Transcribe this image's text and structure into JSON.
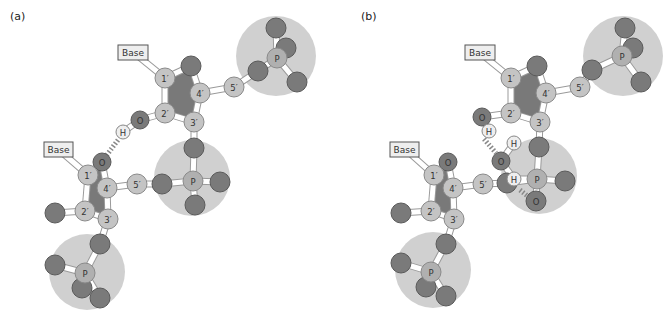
{
  "figure": {
    "panels": [
      {
        "id": "a",
        "label": "(a)",
        "label_pos": [
          10,
          20
        ],
        "phosphate_spheres": [
          {
            "cx": 276,
            "cy": 56,
            "r": 40
          },
          {
            "cx": 192,
            "cy": 178,
            "r": 38
          },
          {
            "cx": 87,
            "cy": 272,
            "r": 38
          }
        ],
        "ring_fills": [
          {
            "points": "165,78 191,66 200,93 194,122 165,113"
          },
          {
            "points": "88,175 102,162 107,188 108,219 85,211"
          }
        ],
        "bonds": [
          [
            133,
            52,
            165,
            78
          ],
          [
            165,
            78,
            191,
            66
          ],
          [
            191,
            66,
            200,
            93
          ],
          [
            200,
            93,
            194,
            122
          ],
          [
            194,
            122,
            165,
            113
          ],
          [
            165,
            113,
            165,
            78
          ],
          [
            200,
            93,
            234,
            87
          ],
          [
            234,
            87,
            258,
            71
          ],
          [
            258,
            71,
            277,
            58
          ],
          [
            277,
            58,
            276,
            28
          ],
          [
            277,
            58,
            297,
            82
          ],
          [
            165,
            113,
            140,
            120
          ],
          [
            140,
            120,
            123,
            132
          ],
          [
            194,
            122,
            194,
            148
          ],
          [
            194,
            148,
            193,
            181
          ],
          [
            193,
            181,
            162,
            184
          ],
          [
            193,
            181,
            220,
            182
          ],
          [
            193,
            181,
            195,
            205
          ],
          [
            58,
            149,
            88,
            175
          ],
          [
            88,
            175,
            102,
            162
          ],
          [
            102,
            162,
            107,
            188
          ],
          [
            107,
            188,
            108,
            219
          ],
          [
            108,
            219,
            85,
            211
          ],
          [
            85,
            211,
            88,
            175
          ],
          [
            107,
            188,
            137,
            184
          ],
          [
            137,
            184,
            162,
            184
          ],
          [
            85,
            211,
            55,
            213
          ],
          [
            108,
            219,
            100,
            244
          ],
          [
            100,
            244,
            85,
            273
          ],
          [
            85,
            273,
            55,
            265
          ],
          [
            85,
            273,
            100,
            298
          ]
        ],
        "hbonds": [
          {
            "x1": 118,
            "y1": 140,
            "x2": 106,
            "y2": 156
          }
        ],
        "atoms": [
          {
            "x": 276,
            "y": 28,
            "r": 10,
            "type": "O",
            "text": ""
          },
          {
            "x": 286,
            "y": 48,
            "r": 10,
            "type": "O",
            "text": ""
          },
          {
            "x": 297,
            "y": 82,
            "r": 10,
            "type": "O",
            "text": ""
          },
          {
            "x": 258,
            "y": 71,
            "r": 10,
            "type": "O",
            "text": ""
          },
          {
            "x": 277,
            "y": 58,
            "r": 10,
            "type": "P",
            "text": "P"
          },
          {
            "x": 191,
            "y": 66,
            "r": 10,
            "type": "O",
            "text": ""
          },
          {
            "x": 165,
            "y": 78,
            "r": 10,
            "type": "C",
            "text": "1′"
          },
          {
            "x": 200,
            "y": 93,
            "r": 10,
            "type": "C",
            "text": "4′"
          },
          {
            "x": 234,
            "y": 87,
            "r": 10,
            "type": "C",
            "text": "5′"
          },
          {
            "x": 165,
            "y": 113,
            "r": 10,
            "type": "C",
            "text": "2′"
          },
          {
            "x": 194,
            "y": 122,
            "r": 10,
            "type": "C",
            "text": "3′"
          },
          {
            "x": 140,
            "y": 120,
            "r": 9,
            "type": "O",
            "text": "O"
          },
          {
            "x": 123,
            "y": 132,
            "r": 7,
            "type": "H",
            "text": "H"
          },
          {
            "x": 194,
            "y": 148,
            "r": 10,
            "type": "O",
            "text": ""
          },
          {
            "x": 162,
            "y": 184,
            "r": 10,
            "type": "O",
            "text": ""
          },
          {
            "x": 220,
            "y": 182,
            "r": 10,
            "type": "O",
            "text": ""
          },
          {
            "x": 195,
            "y": 205,
            "r": 10,
            "type": "O",
            "text": ""
          },
          {
            "x": 193,
            "y": 181,
            "r": 10,
            "type": "P",
            "text": "P"
          },
          {
            "x": 102,
            "y": 162,
            "r": 9,
            "type": "O",
            "text": "O"
          },
          {
            "x": 88,
            "y": 175,
            "r": 10,
            "type": "C",
            "text": "1′"
          },
          {
            "x": 107,
            "y": 188,
            "r": 10,
            "type": "C",
            "text": "4′"
          },
          {
            "x": 137,
            "y": 184,
            "r": 10,
            "type": "C",
            "text": "5′"
          },
          {
            "x": 85,
            "y": 211,
            "r": 10,
            "type": "C",
            "text": "2′"
          },
          {
            "x": 108,
            "y": 219,
            "r": 10,
            "type": "C",
            "text": "3′"
          },
          {
            "x": 55,
            "y": 213,
            "r": 10,
            "type": "O",
            "text": ""
          },
          {
            "x": 100,
            "y": 244,
            "r": 10,
            "type": "O",
            "text": ""
          },
          {
            "x": 55,
            "y": 265,
            "r": 10,
            "type": "O",
            "text": ""
          },
          {
            "x": 82,
            "y": 288,
            "r": 10,
            "type": "O",
            "text": ""
          },
          {
            "x": 100,
            "y": 298,
            "r": 10,
            "type": "O",
            "text": ""
          },
          {
            "x": 85,
            "y": 273,
            "r": 10,
            "type": "P",
            "text": "P"
          }
        ],
        "base_boxes": [
          {
            "x": 118,
            "y": 45,
            "w": 30,
            "h": 15,
            "text": "Base"
          },
          {
            "x": 44,
            "y": 142,
            "w": 29,
            "h": 15,
            "text": "Base"
          }
        ]
      },
      {
        "id": "b",
        "label": "(b)",
        "label_pos": [
          361,
          20
        ],
        "phosphate_spheres": [
          {
            "cx": 623,
            "cy": 56,
            "r": 40
          },
          {
            "cx": 539,
            "cy": 176,
            "r": 38
          },
          {
            "cx": 433,
            "cy": 270,
            "r": 38
          }
        ],
        "ring_fills": [
          {
            "points": "511,78 537,66 546,93 540,122 511,113"
          },
          {
            "points": "434,175 448,162 453,188 454,219 431,211"
          }
        ],
        "bonds": [
          [
            479,
            52,
            511,
            78
          ],
          [
            511,
            78,
            537,
            66
          ],
          [
            537,
            66,
            546,
            93
          ],
          [
            546,
            93,
            540,
            122
          ],
          [
            540,
            122,
            511,
            113
          ],
          [
            511,
            113,
            511,
            78
          ],
          [
            546,
            93,
            580,
            87
          ],
          [
            580,
            87,
            592,
            70
          ],
          [
            592,
            70,
            622,
            56
          ],
          [
            622,
            56,
            625,
            28
          ],
          [
            622,
            56,
            641,
            82
          ],
          [
            511,
            113,
            482,
            117
          ],
          [
            482,
            117,
            489,
            131
          ],
          [
            540,
            122,
            539,
            147
          ],
          [
            539,
            147,
            537,
            179
          ],
          [
            537,
            179,
            507,
            183
          ],
          [
            537,
            179,
            565,
            181
          ],
          [
            537,
            179,
            536,
            201
          ],
          [
            501,
            161,
            514,
            143
          ],
          [
            501,
            161,
            514,
            179
          ],
          [
            514,
            179,
            537,
            179
          ],
          [
            405,
            149,
            434,
            175
          ],
          [
            434,
            175,
            448,
            162
          ],
          [
            448,
            162,
            453,
            188
          ],
          [
            453,
            188,
            454,
            219
          ],
          [
            454,
            219,
            431,
            211
          ],
          [
            431,
            211,
            434,
            175
          ],
          [
            453,
            188,
            483,
            184
          ],
          [
            483,
            184,
            507,
            183
          ],
          [
            431,
            211,
            401,
            213
          ],
          [
            454,
            219,
            446,
            244
          ],
          [
            446,
            244,
            431,
            272
          ],
          [
            431,
            272,
            401,
            263
          ],
          [
            431,
            272,
            446,
            296
          ]
        ],
        "hbonds": [
          {
            "x1": 484,
            "y1": 139,
            "x2": 496,
            "y2": 153
          },
          {
            "x1": 520,
            "y1": 190,
            "x2": 530,
            "y2": 198
          }
        ],
        "atoms": [
          {
            "x": 625,
            "y": 28,
            "r": 10,
            "type": "O",
            "text": ""
          },
          {
            "x": 633,
            "y": 48,
            "r": 10,
            "type": "O",
            "text": ""
          },
          {
            "x": 641,
            "y": 82,
            "r": 10,
            "type": "O",
            "text": ""
          },
          {
            "x": 592,
            "y": 70,
            "r": 10,
            "type": "O",
            "text": ""
          },
          {
            "x": 622,
            "y": 56,
            "r": 10,
            "type": "P",
            "text": "P"
          },
          {
            "x": 537,
            "y": 66,
            "r": 10,
            "type": "O",
            "text": ""
          },
          {
            "x": 511,
            "y": 78,
            "r": 10,
            "type": "C",
            "text": "1′"
          },
          {
            "x": 546,
            "y": 93,
            "r": 10,
            "type": "C",
            "text": "4′"
          },
          {
            "x": 580,
            "y": 87,
            "r": 10,
            "type": "C",
            "text": "5′"
          },
          {
            "x": 511,
            "y": 113,
            "r": 10,
            "type": "C",
            "text": "2′"
          },
          {
            "x": 540,
            "y": 122,
            "r": 10,
            "type": "C",
            "text": "3′"
          },
          {
            "x": 482,
            "y": 117,
            "r": 9,
            "type": "O",
            "text": "O"
          },
          {
            "x": 489,
            "y": 131,
            "r": 7,
            "type": "H",
            "text": "H"
          },
          {
            "x": 539,
            "y": 147,
            "r": 10,
            "type": "O",
            "text": ""
          },
          {
            "x": 507,
            "y": 183,
            "r": 10,
            "type": "O",
            "text": ""
          },
          {
            "x": 565,
            "y": 181,
            "r": 10,
            "type": "O",
            "text": ""
          },
          {
            "x": 536,
            "y": 201,
            "r": 10,
            "type": "O",
            "text": "O"
          },
          {
            "x": 501,
            "y": 161,
            "r": 9,
            "type": "O",
            "text": "O"
          },
          {
            "x": 514,
            "y": 143,
            "r": 7,
            "type": "H",
            "text": "H"
          },
          {
            "x": 514,
            "y": 179,
            "r": 7,
            "type": "H",
            "text": "H"
          },
          {
            "x": 537,
            "y": 179,
            "r": 10,
            "type": "P",
            "text": "P"
          },
          {
            "x": 448,
            "y": 162,
            "r": 9,
            "type": "O",
            "text": "O"
          },
          {
            "x": 434,
            "y": 175,
            "r": 10,
            "type": "C",
            "text": "1′"
          },
          {
            "x": 453,
            "y": 188,
            "r": 10,
            "type": "C",
            "text": "4′"
          },
          {
            "x": 483,
            "y": 184,
            "r": 10,
            "type": "C",
            "text": "5′"
          },
          {
            "x": 431,
            "y": 211,
            "r": 10,
            "type": "C",
            "text": "2′"
          },
          {
            "x": 454,
            "y": 219,
            "r": 10,
            "type": "C",
            "text": "3′"
          },
          {
            "x": 401,
            "y": 213,
            "r": 10,
            "type": "O",
            "text": ""
          },
          {
            "x": 446,
            "y": 244,
            "r": 10,
            "type": "O",
            "text": ""
          },
          {
            "x": 401,
            "y": 263,
            "r": 10,
            "type": "O",
            "text": ""
          },
          {
            "x": 426,
            "y": 287,
            "r": 10,
            "type": "O",
            "text": ""
          },
          {
            "x": 446,
            "y": 296,
            "r": 10,
            "type": "O",
            "text": ""
          },
          {
            "x": 431,
            "y": 272,
            "r": 10,
            "type": "P",
            "text": "P"
          }
        ],
        "base_boxes": [
          {
            "x": 465,
            "y": 45,
            "w": 30,
            "h": 15,
            "text": "Base"
          },
          {
            "x": 390,
            "y": 142,
            "w": 29,
            "h": 15,
            "text": "Base"
          }
        ]
      }
    ],
    "colors": {
      "background": "#ffffff",
      "phosphate_sphere": "#c8c8c8",
      "oxygen": "#7a7a7a",
      "oxygen_stroke": "#5a5a5a",
      "carbon": "#c4c4c4",
      "carbon_stroke": "#8a8a8a",
      "phosphorus": "#b0b0b0",
      "hydrogen": "#eeeeee",
      "bond": "#ffffff",
      "bond_stroke": "#9a9a9a",
      "ring_fill": "#6a6a6a",
      "base_box_fill": "#eeeeee",
      "base_box_stroke": "#555555",
      "hbond": "#888888"
    }
  }
}
